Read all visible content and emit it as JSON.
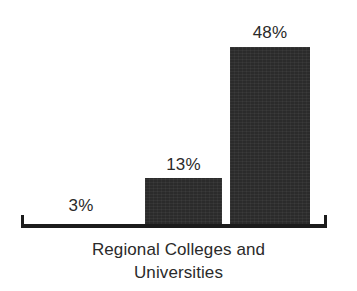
{
  "figure": {
    "background_color": "#ffffff",
    "caption_lines": [
      "Regional Colleges and",
      "Universities"
    ]
  },
  "chart_data": {
    "type": "bar",
    "title": "",
    "subtitle": "",
    "xlabel": "Regional Colleges and Universities",
    "ylabel": "",
    "categories": [
      "3%",
      "13%",
      "48%"
    ],
    "values": [
      3,
      13,
      48
    ],
    "value_labels": [
      "3%",
      "13%",
      "48%"
    ],
    "ylim": [
      0,
      55
    ],
    "grid": false,
    "legend": null,
    "legend_position": "none",
    "bar_color": "#2b2b2b",
    "axis_color": "#1c1c1c",
    "label_color": "#2a2a2a",
    "annotations": [
      "3%",
      "13%",
      "48%"
    ]
  }
}
